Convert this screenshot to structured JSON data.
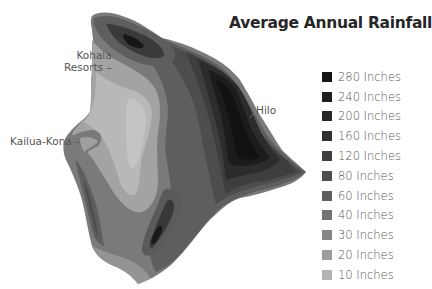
{
  "title": "Average Annual Rainfall",
  "legend": [
    {
      "label": "280 Inches",
      "color": "#151515"
    },
    {
      "label": "240 Inches",
      "color": "#1f1f1f"
    },
    {
      "label": "200 Inches",
      "color": "#262626"
    },
    {
      "label": "160 Inches",
      "color": "#303030"
    },
    {
      "label": "120 Inches",
      "color": "#3e3e3e"
    },
    {
      "label": "80 Inches",
      "color": "#4d4d4d"
    },
    {
      "label": "60 Inches",
      "color": "#5e5e5e"
    },
    {
      "label": "40 Inches",
      "color": "#727272"
    },
    {
      "label": "30 Inches",
      "color": "#858585"
    },
    {
      "label": "20 Inches",
      "color": "#9c9c9c"
    },
    {
      "label": "10 Inches",
      "color": "#b4b4b4"
    }
  ],
  "places": [
    {
      "name": "Kohala",
      "name2": "Resorts"
    },
    {
      "name": "Kailua-Kona"
    },
    {
      "name": "Hilo"
    }
  ]
}
